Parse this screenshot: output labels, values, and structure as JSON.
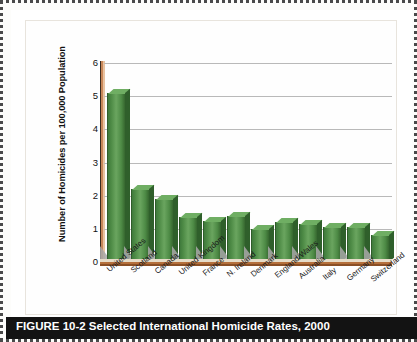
{
  "figure": {
    "caption": "FIGURE 10-2   Selected International Homicide Rates, 2000"
  },
  "chart_data": {
    "type": "bar",
    "title": "",
    "xlabel": "",
    "ylabel": "Number of Homicides per 100,000 Population",
    "ylim": [
      0,
      6
    ],
    "yticks": [
      "6",
      "5",
      "4",
      "3",
      "2",
      "1",
      "0"
    ],
    "grid": true,
    "legend": "none",
    "bar_color": "#4e8b46",
    "axis_color": "#b5703c",
    "categories": [
      "United States",
      "Scotland",
      "Canada",
      "United Kingdom",
      "France",
      "N. Ireland",
      "Denmark",
      "England/Wales",
      "Australia",
      "Italy",
      "Germany",
      "Switzerland"
    ],
    "values": [
      5.1,
      2.2,
      1.9,
      1.35,
      1.25,
      1.4,
      1.0,
      1.2,
      1.15,
      1.05,
      1.05,
      0.8
    ]
  }
}
